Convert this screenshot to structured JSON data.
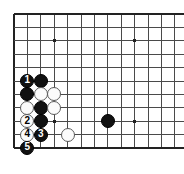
{
  "diagram": {
    "type": "go-board-problem",
    "board_style": "19x19-corner-crop",
    "colors": {
      "board_background": "#ffffff",
      "line": "#4a4a4a",
      "edge_line": "#222222",
      "black_stone": "#111111",
      "white_stone": "#fbfbfb",
      "white_stone_border": "#5a5a5a",
      "black_label_text": "#ffffff",
      "white_label_text": "#000000"
    },
    "grid": {
      "origin_x": 14,
      "origin_y": 14,
      "spacing": 13.4,
      "cols": 13,
      "rows": 11,
      "left_edge": true,
      "top_edge": true,
      "bottom_edge": true,
      "right_edge": false
    },
    "star_points": [
      {
        "col": 4,
        "row": 3
      },
      {
        "col": 10,
        "row": 3
      },
      {
        "col": 4,
        "row": 9
      },
      {
        "col": 10,
        "row": 9
      }
    ],
    "stones": [
      {
        "col": 2,
        "row": 6,
        "color": "black",
        "label": "1"
      },
      {
        "col": 3,
        "row": 6,
        "color": "black",
        "label": ""
      },
      {
        "col": 2,
        "row": 7,
        "color": "black",
        "label": ""
      },
      {
        "col": 3,
        "row": 7,
        "color": "white",
        "label": ""
      },
      {
        "col": 4,
        "row": 7,
        "color": "white",
        "label": ""
      },
      {
        "col": 2,
        "row": 8,
        "color": "white",
        "label": ""
      },
      {
        "col": 3,
        "row": 8,
        "color": "black",
        "label": ""
      },
      {
        "col": 4,
        "row": 8,
        "color": "white",
        "label": ""
      },
      {
        "col": 2,
        "row": 9,
        "color": "white",
        "label": "2"
      },
      {
        "col": 3,
        "row": 9,
        "color": "black",
        "label": ""
      },
      {
        "col": 2,
        "row": 10,
        "color": "white",
        "label": "4"
      },
      {
        "col": 3,
        "row": 10,
        "color": "black",
        "label": "3"
      },
      {
        "col": 5,
        "row": 10,
        "color": "white",
        "label": ""
      },
      {
        "col": 2,
        "row": 11,
        "color": "black",
        "label": "5"
      },
      {
        "col": 8,
        "row": 9,
        "color": "black",
        "label": ""
      }
    ],
    "move_sequence": [
      {
        "number": "1",
        "color": "black"
      },
      {
        "number": "2",
        "color": "white"
      },
      {
        "number": "3",
        "color": "black"
      },
      {
        "number": "4",
        "color": "white"
      },
      {
        "number": "5",
        "color": "black"
      }
    ]
  }
}
